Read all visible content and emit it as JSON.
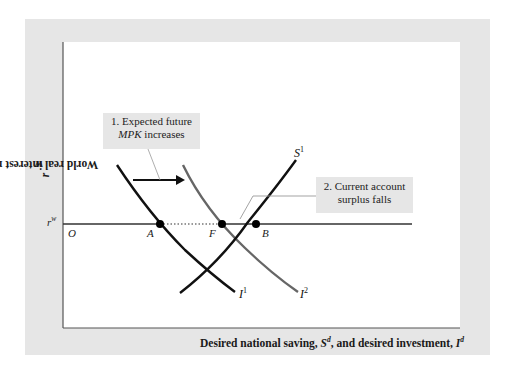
{
  "figure": {
    "y_axis_label": "World real interest rate, ",
    "y_axis_var": "r",
    "y_axis_var_sup": "w",
    "x_axis_label_1": "Desired national saving, ",
    "x_axis_var_1": "S",
    "x_axis_var_1_sup": "d",
    "x_axis_label_2": ", and desired investment, ",
    "x_axis_var_2": "I",
    "x_axis_var_2_sup": "d",
    "rate_label": "r",
    "rate_label_sup": "w",
    "origin_label": "O",
    "points": {
      "A": "A",
      "F": "F",
      "B": "B"
    },
    "curves": {
      "I1": {
        "letter": "I",
        "sup": "1"
      },
      "I2": {
        "letter": "I",
        "sup": "2"
      },
      "S1": {
        "letter": "S",
        "sup": "1"
      }
    },
    "callout1": {
      "line1": "1. Expected future",
      "line2_italic": "MPK",
      "line2_rest": " increases"
    },
    "callout2": {
      "line1": "2. Current account",
      "line2": "surplus falls"
    },
    "colors": {
      "frame": "#e6e6e6",
      "curve_primary": "#111111",
      "curve_shifted": "#666666",
      "leader_line": "#888888"
    }
  }
}
